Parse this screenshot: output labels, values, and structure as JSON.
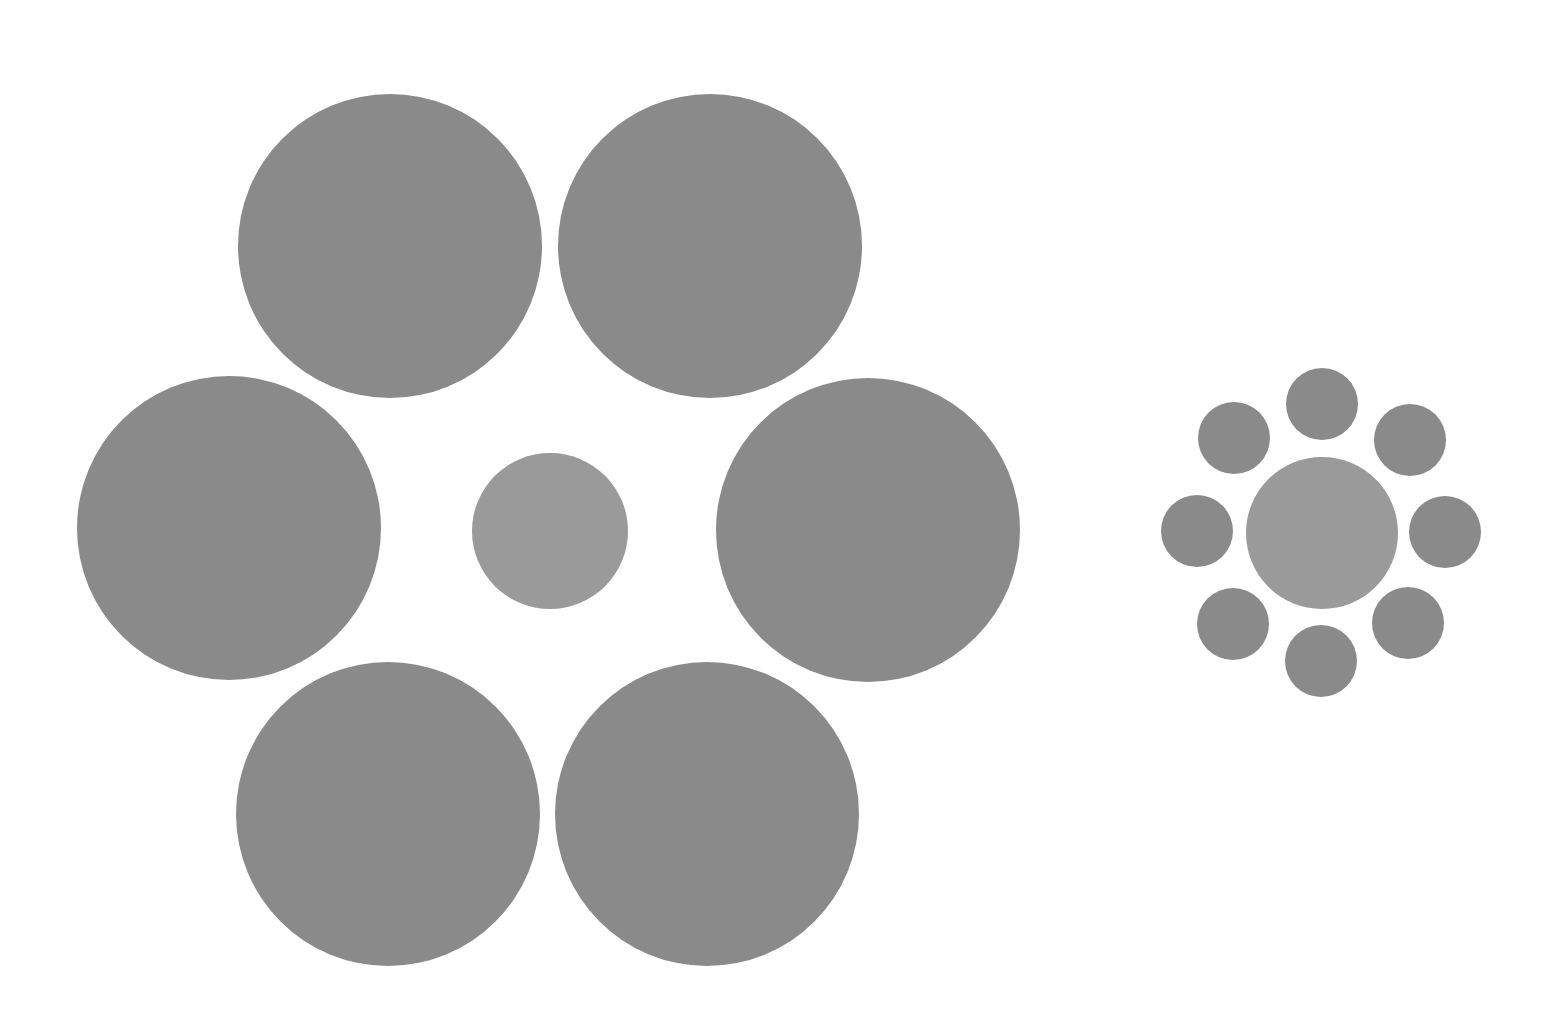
{
  "figure": {
    "title": "",
    "background": "#ffffff",
    "colors": {
      "outer": "#8a8a8a",
      "inner": "#9a9a9a"
    },
    "groups": [
      {
        "name": "large-surround-group",
        "center": {
          "cx": 550,
          "cy": 531,
          "r": 78,
          "role": "inner"
        },
        "surround": [
          {
            "cx": 390,
            "cy": 246,
            "r": 152
          },
          {
            "cx": 710,
            "cy": 246,
            "r": 152
          },
          {
            "cx": 229,
            "cy": 528,
            "r": 152
          },
          {
            "cx": 868,
            "cy": 530,
            "r": 152
          },
          {
            "cx": 388,
            "cy": 814,
            "r": 152
          },
          {
            "cx": 707,
            "cy": 814,
            "r": 152
          }
        ]
      },
      {
        "name": "small-surround-group",
        "center": {
          "cx": 1322,
          "cy": 533,
          "r": 76,
          "role": "inner"
        },
        "surround": [
          {
            "cx": 1322,
            "cy": 404,
            "r": 36
          },
          {
            "cx": 1410,
            "cy": 440,
            "r": 36
          },
          {
            "cx": 1445,
            "cy": 532,
            "r": 36
          },
          {
            "cx": 1408,
            "cy": 623,
            "r": 36
          },
          {
            "cx": 1321,
            "cy": 661,
            "r": 36
          },
          {
            "cx": 1233,
            "cy": 624,
            "r": 36
          },
          {
            "cx": 1197,
            "cy": 531,
            "r": 36
          },
          {
            "cx": 1234,
            "cy": 438,
            "r": 36
          }
        ]
      }
    ]
  }
}
